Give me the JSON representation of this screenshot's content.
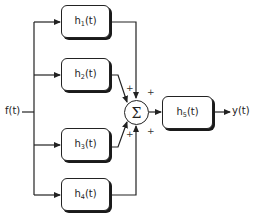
{
  "input": {
    "label": "f(t)"
  },
  "output": {
    "label": "y(t)"
  },
  "blocks": [
    {
      "id": "h1",
      "base": "h",
      "sub": "1",
      "suffix": "(t)"
    },
    {
      "id": "h2",
      "base": "h",
      "sub": "2",
      "suffix": "(t)"
    },
    {
      "id": "h3",
      "base": "h",
      "sub": "3",
      "suffix": "(t)"
    },
    {
      "id": "h4",
      "base": "h",
      "sub": "4",
      "suffix": "(t)"
    },
    {
      "id": "h5",
      "base": "h",
      "sub": "5",
      "suffix": "(t)"
    }
  ],
  "summer": {
    "symbol": "Σ",
    "signs": [
      "+",
      "+",
      "+",
      "+"
    ]
  }
}
